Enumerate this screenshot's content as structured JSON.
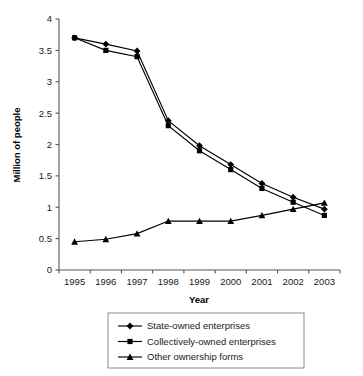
{
  "chart_data": {
    "type": "line",
    "title": "",
    "xlabel": "Year",
    "ylabel": "Million of people",
    "categories": [
      "1995",
      "1996",
      "1997",
      "1998",
      "1999",
      "2000",
      "2001",
      "2002",
      "2003"
    ],
    "x": [
      1995,
      1996,
      1997,
      1998,
      1999,
      2000,
      2001,
      2002,
      2003
    ],
    "xlim": [
      1995,
      2003
    ],
    "ylim": [
      0,
      4
    ],
    "ytick_step": 0.5,
    "yticks": [
      "0",
      "0.5",
      "1",
      "1.5",
      "2",
      "2.5",
      "3",
      "3.5",
      "4"
    ],
    "ytick_values": [
      0,
      0.5,
      1,
      1.5,
      2,
      2.5,
      3,
      3.5,
      4
    ],
    "grid": false,
    "legend_position": "below-outside",
    "axes_visible": [
      "left",
      "bottom"
    ],
    "series": [
      {
        "name": "State-owned enterprises",
        "marker": "diamond",
        "color": "#000000",
        "values": [
          3.7,
          3.6,
          3.49,
          2.38,
          1.98,
          1.68,
          1.38,
          1.16,
          0.97
        ]
      },
      {
        "name": "Collectively-owned enterprises",
        "marker": "square",
        "color": "#000000",
        "values": [
          3.7,
          3.5,
          3.4,
          2.3,
          1.9,
          1.6,
          1.3,
          1.08,
          0.87
        ]
      },
      {
        "name": "Other ownership forms",
        "marker": "triangle",
        "color": "#000000",
        "values": [
          0.45,
          0.49,
          0.58,
          0.78,
          0.78,
          0.78,
          0.87,
          0.97,
          1.07
        ]
      }
    ]
  },
  "legend": {
    "items": [
      {
        "label": "State-owned enterprises",
        "marker": "diamond"
      },
      {
        "label": "Collectively-owned enterprises",
        "marker": "square"
      },
      {
        "label": "Other ownership forms",
        "marker": "triangle"
      }
    ]
  },
  "axis": {
    "y_title": "Million of people",
    "x_title": "Year"
  }
}
